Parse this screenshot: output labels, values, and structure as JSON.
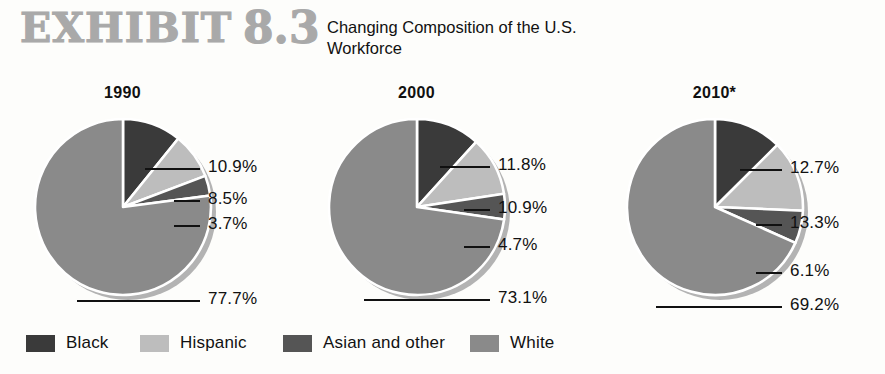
{
  "header": {
    "exhibit_word": "EXHIBIT",
    "exhibit_number": "8.3",
    "subtitle": "Changing Composition of the U.S. Workforce",
    "exhibit_color": "#a9a9a9"
  },
  "colors": {
    "black": "#3a3a3a",
    "hispanic": "#bdbdbd",
    "asian": "#555555",
    "white_cat": "#8a8a8a",
    "separator": "#ffffff",
    "shadow": "#b3b3b3",
    "text": "#111111",
    "background": "#fdfdfb"
  },
  "legend": {
    "items": [
      {
        "label": "Black",
        "color": "#3a3a3a"
      },
      {
        "label": "Hispanic",
        "color": "#bdbdbd"
      },
      {
        "label": "Asian and other",
        "color": "#555555"
      },
      {
        "label": "White",
        "color": "#8a8a8a"
      }
    ]
  },
  "chart_data": {
    "type": "pie",
    "title": "Changing Composition of the U.S. Workforce",
    "subtitle": "EXHIBIT 8.3",
    "legend_position": "bottom",
    "note": "2010 values are projected, indicated by asterisk",
    "categories": [
      "Black",
      "Hispanic",
      "Asian and other",
      "White"
    ],
    "category_colors": [
      "#3a3a3a",
      "#bdbdbd",
      "#555555",
      "#8a8a8a"
    ],
    "charts": [
      {
        "title": "1990",
        "values": [
          10.9,
          8.5,
          3.7,
          77.7
        ],
        "labels": [
          "10.9%",
          "8.5%",
          "3.7%",
          "77.7%"
        ]
      },
      {
        "title": "2000",
        "values": [
          11.8,
          10.9,
          4.7,
          73.1
        ],
        "labels": [
          "11.8%",
          "10.9%",
          "4.7%",
          "73.1%"
        ]
      },
      {
        "title": "2010*",
        "values": [
          12.7,
          13.3,
          6.1,
          69.2
        ],
        "labels": [
          "12.7%",
          "13.3%",
          "6.1%",
          "69.2%"
        ]
      }
    ]
  }
}
